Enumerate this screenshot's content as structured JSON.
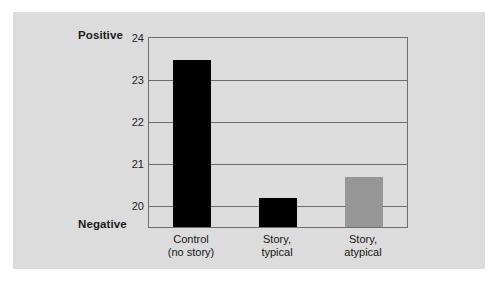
{
  "chart_data": {
    "type": "bar",
    "title": "",
    "xlabel": "",
    "ylabel": "",
    "categories": [
      "Control\n(no story)",
      "Story,\ntypical",
      "Story,\natypical"
    ],
    "category_lines": [
      [
        "Control",
        "(no story)"
      ],
      [
        "Story,",
        "typical"
      ],
      [
        "Story,",
        "atypical"
      ]
    ],
    "values": [
      23.47,
      20.2,
      20.7
    ],
    "bar_colors": [
      "#000000",
      "#000000",
      "#969696"
    ],
    "ylim": [
      19.5,
      24
    ],
    "yticks": [
      24,
      23,
      22,
      21,
      20
    ],
    "ytick_labels": [
      "24",
      "23",
      "22",
      "21",
      "20"
    ],
    "grid": true,
    "legend": null,
    "axis_endpoint_labels": {
      "top": "Positive",
      "bottom": "Negative"
    }
  },
  "colors": {
    "panel_background": "#dcdcdc",
    "page_background": "#ffffff",
    "axis_line": "#6e6e6e",
    "bar_dark": "#000000",
    "bar_gray": "#969696",
    "text": "#161616"
  }
}
